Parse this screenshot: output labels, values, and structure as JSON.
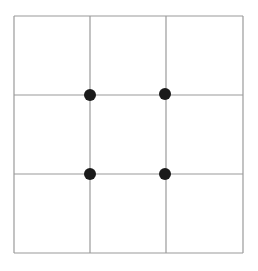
{
  "diagram": {
    "type": "rule-of-thirds-grid",
    "frame": {
      "left": 14,
      "top": 16,
      "right": 243,
      "bottom": 253
    },
    "vertical_lines": [
      90,
      166
    ],
    "horizontal_lines": [
      95,
      174
    ],
    "intersections": [
      {
        "x": 90,
        "y": 95
      },
      {
        "x": 165,
        "y": 94
      },
      {
        "x": 90,
        "y": 174
      },
      {
        "x": 165,
        "y": 174
      }
    ],
    "colors": {
      "background": "#ffffff",
      "line": "#9a9a9a",
      "dot": "#1a1a1a"
    },
    "dot_radius": 6
  }
}
